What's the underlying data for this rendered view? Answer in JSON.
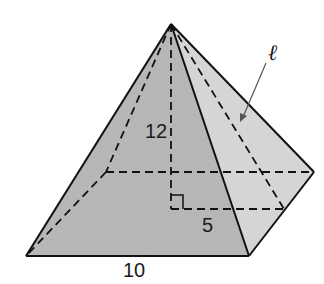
{
  "diagram": {
    "type": "square-pyramid",
    "labels": {
      "height": "12",
      "half_base": "5",
      "base_edge": "10",
      "slant_height": "ℓ"
    },
    "colors": {
      "front_face": "#b9b9b9",
      "right_face": "#d8d8d8",
      "edge": "#111111"
    }
  }
}
